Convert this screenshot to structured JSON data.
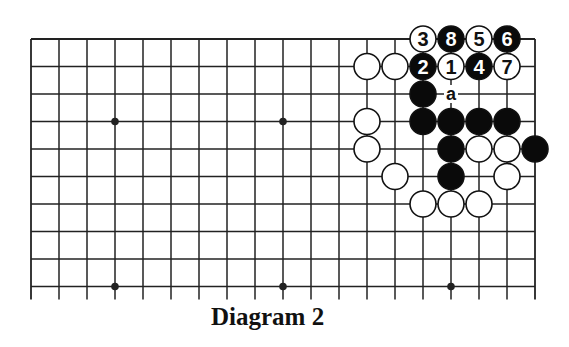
{
  "diagram": {
    "caption": "Diagram 2",
    "board": {
      "columns": 19,
      "rows_visible": 10,
      "origin_x": 31,
      "origin_y": 39,
      "spacing_x": 28,
      "spacing_y": 27.5,
      "bottom_extend": 13,
      "top_edge": true,
      "left_edge": true,
      "right_edge": true,
      "line_color": "#222222",
      "star_points": [
        [
          3,
          3
        ],
        [
          9,
          3
        ],
        [
          15,
          3
        ],
        [
          3,
          9
        ],
        [
          9,
          9
        ],
        [
          15,
          9
        ]
      ]
    },
    "stones": [
      {
        "col": 14,
        "row": 0,
        "color": "white",
        "label": "3"
      },
      {
        "col": 15,
        "row": 0,
        "color": "black",
        "label": "8"
      },
      {
        "col": 16,
        "row": 0,
        "color": "white",
        "label": "5"
      },
      {
        "col": 17,
        "row": 0,
        "color": "black",
        "label": "6"
      },
      {
        "col": 12,
        "row": 1,
        "color": "white",
        "label": ""
      },
      {
        "col": 13,
        "row": 1,
        "color": "white",
        "label": ""
      },
      {
        "col": 14,
        "row": 1,
        "color": "black",
        "label": "2"
      },
      {
        "col": 15,
        "row": 1,
        "color": "white",
        "label": "1"
      },
      {
        "col": 16,
        "row": 1,
        "color": "black",
        "label": "4"
      },
      {
        "col": 17,
        "row": 1,
        "color": "white",
        "label": "7"
      },
      {
        "col": 14,
        "row": 2,
        "color": "black",
        "label": ""
      },
      {
        "col": 12,
        "row": 3,
        "color": "white",
        "label": ""
      },
      {
        "col": 14,
        "row": 3,
        "color": "black",
        "label": ""
      },
      {
        "col": 15,
        "row": 3,
        "color": "black",
        "label": ""
      },
      {
        "col": 16,
        "row": 3,
        "color": "black",
        "label": ""
      },
      {
        "col": 17,
        "row": 3,
        "color": "black",
        "label": ""
      },
      {
        "col": 12,
        "row": 4,
        "color": "white",
        "label": ""
      },
      {
        "col": 15,
        "row": 4,
        "color": "black",
        "label": ""
      },
      {
        "col": 16,
        "row": 4,
        "color": "white",
        "label": ""
      },
      {
        "col": 17,
        "row": 4,
        "color": "white",
        "label": ""
      },
      {
        "col": 18,
        "row": 4,
        "color": "black",
        "label": ""
      },
      {
        "col": 13,
        "row": 5,
        "color": "white",
        "label": ""
      },
      {
        "col": 15,
        "row": 5,
        "color": "black",
        "label": ""
      },
      {
        "col": 17,
        "row": 5,
        "color": "white",
        "label": ""
      },
      {
        "col": 14,
        "row": 6,
        "color": "white",
        "label": ""
      },
      {
        "col": 15,
        "row": 6,
        "color": "white",
        "label": ""
      },
      {
        "col": 16,
        "row": 6,
        "color": "white",
        "label": ""
      }
    ],
    "markers": [
      {
        "col": 15,
        "row": 2,
        "label": "a"
      }
    ],
    "colors": {
      "black_stone": "#0a0a0a",
      "white_stone": "#ffffff",
      "stone_outline": "#111111",
      "background": "#ffffff"
    }
  }
}
